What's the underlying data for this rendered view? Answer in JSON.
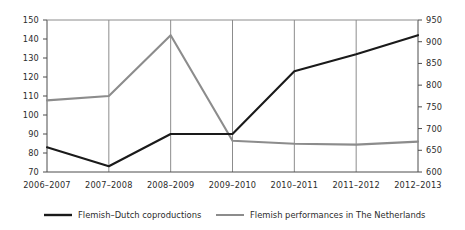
{
  "chart_data": {
    "type": "line",
    "title": "",
    "xlabel": "",
    "categories": [
      "2006–2007",
      "2007–2008",
      "2008–2009",
      "2009–2010",
      "2010–2011",
      "2011–2012",
      "2012–2013"
    ],
    "grid": true,
    "grid_orientation": "vertical",
    "legend_position": "bottom",
    "series": [
      {
        "name": "Flemish–Dutch coproductions",
        "axis": "left",
        "color": "#1a1a1a",
        "values": [
          83,
          73,
          90,
          90,
          123,
          132,
          142
        ]
      },
      {
        "name": "Flemish performances in The Netherlands",
        "axis": "right",
        "color": "#8c8c8c",
        "values": [
          765,
          775,
          915,
          672,
          665,
          663,
          670
        ]
      }
    ],
    "axes": {
      "left": {
        "label": "",
        "ylim": [
          70,
          150
        ],
        "step": 10,
        "ticks": [
          150,
          140,
          130,
          120,
          110,
          100,
          90,
          80,
          70
        ]
      },
      "right": {
        "label": "",
        "ylim": [
          600,
          950
        ],
        "step": 50,
        "ticks": [
          950,
          900,
          850,
          800,
          750,
          700,
          650,
          600
        ]
      }
    }
  },
  "legend": {
    "items": [
      {
        "label": "Flemish–Dutch coproductions",
        "color": "#1a1a1a"
      },
      {
        "label": "Flemish performances in The Netherlands",
        "color": "#8c8c8c"
      }
    ]
  },
  "colors": {
    "background": "#ffffff",
    "axis": "#4d4d4d",
    "grid": "#8c8c8c",
    "series_primary": "#1a1a1a",
    "series_secondary": "#8c8c8c",
    "text": "#2b2b2b"
  }
}
